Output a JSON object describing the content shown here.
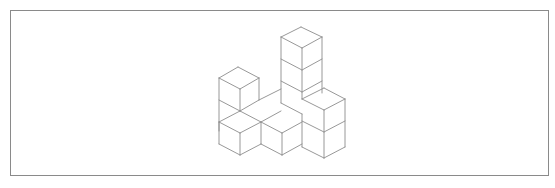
{
  "figure": {
    "line_color": "#8c8c8c",
    "frame_color": "#8a8a8a",
    "cube_count_visible": 9
  },
  "edges": [
    [
      301,
      27,
      281,
      37
    ],
    [
      301,
      27,
      322,
      37
    ],
    [
      281,
      37,
      302,
      48
    ],
    [
      322,
      37,
      302,
      48
    ],
    [
      281,
      37,
      281,
      103
    ],
    [
      302,
      48,
      302,
      99
    ],
    [
      322,
      37,
      322,
      93
    ],
    [
      281,
      59,
      302,
      70
    ],
    [
      302,
      70,
      322,
      59
    ],
    [
      281,
      81,
      302,
      92
    ],
    [
      302,
      92,
      322,
      81
    ],
    [
      238,
      67,
      219,
      78
    ],
    [
      238,
      67,
      259,
      78
    ],
    [
      219,
      78,
      240,
      89
    ],
    [
      259,
      78,
      240,
      89
    ],
    [
      219,
      78,
      219,
      131
    ],
    [
      240,
      89,
      240,
      111
    ],
    [
      259,
      78,
      259,
      100
    ],
    [
      219,
      100,
      240,
      111
    ],
    [
      240,
      111,
      259,
      100
    ],
    [
      259,
      100,
      281,
      89
    ],
    [
      324,
      88,
      302,
      99
    ],
    [
      324,
      88,
      345,
      99
    ],
    [
      302,
      99,
      324,
      110
    ],
    [
      345,
      99,
      324,
      110
    ],
    [
      324,
      110,
      324,
      158
    ],
    [
      345,
      99,
      345,
      147
    ],
    [
      302,
      121,
      324,
      132
    ],
    [
      324,
      132,
      345,
      121
    ],
    [
      324,
      158,
      345,
      147
    ],
    [
      302,
      147,
      324,
      158
    ],
    [
      240,
      111,
      261,
      122
    ],
    [
      261,
      122,
      281,
      111
    ],
    [
      281,
      103,
      302,
      114
    ],
    [
      302,
      114,
      302,
      147
    ],
    [
      219,
      122,
      240,
      111
    ],
    [
      219,
      122,
      240,
      133
    ],
    [
      240,
      133,
      261,
      122
    ],
    [
      219,
      122,
      219,
      144
    ],
    [
      240,
      133,
      240,
      155
    ],
    [
      219,
      144,
      240,
      155
    ],
    [
      240,
      155,
      261,
      144
    ],
    [
      261,
      122,
      261,
      144
    ],
    [
      261,
      122,
      282,
      133
    ],
    [
      282,
      133,
      302,
      122
    ],
    [
      282,
      133,
      282,
      155
    ],
    [
      261,
      144,
      282,
      155
    ],
    [
      282,
      155,
      302,
      144
    ]
  ]
}
